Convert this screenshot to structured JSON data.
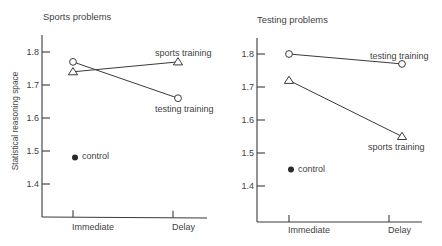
{
  "chart_data": [
    {
      "type": "line",
      "title": "Sports problems",
      "xlabel": "",
      "ylabel": "Statistical reasoning space",
      "categories": [
        "Immediate",
        "Delay"
      ],
      "yticks": [
        "1.8",
        "1.7",
        "1.6",
        "1.5",
        "1.4"
      ],
      "ylim": [
        1.3,
        1.85
      ],
      "grid": false,
      "legend": "inline labels next to series",
      "series": [
        {
          "name": "sports training",
          "marker": "open-triangle",
          "values": [
            1.74,
            1.77
          ]
        },
        {
          "name": "testing training",
          "marker": "open-circle",
          "values": [
            1.77,
            1.66
          ]
        },
        {
          "name": "control",
          "marker": "filled-circle",
          "values": [
            1.48,
            null
          ]
        }
      ]
    },
    {
      "type": "line",
      "title": "Testing problems",
      "xlabel": "",
      "ylabel": "",
      "categories": [
        "Immediate",
        "Delay"
      ],
      "yticks": [
        "1.8",
        "1.7",
        "1.6",
        "1.5",
        "1.4"
      ],
      "ylim": [
        1.3,
        1.85
      ],
      "grid": false,
      "legend": "inline labels next to series",
      "series": [
        {
          "name": "testing training",
          "marker": "open-circle",
          "values": [
            1.8,
            1.77
          ]
        },
        {
          "name": "sports training",
          "marker": "open-triangle",
          "values": [
            1.72,
            1.55
          ]
        },
        {
          "name": "control",
          "marker": "filled-circle",
          "values": [
            1.45,
            null
          ]
        }
      ]
    }
  ],
  "colors": {
    "ink": "#3a3a3a",
    "background": "#ffffff"
  }
}
